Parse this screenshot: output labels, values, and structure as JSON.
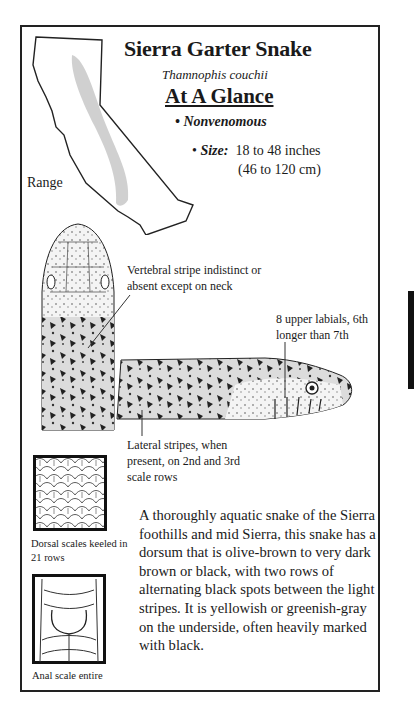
{
  "header": {
    "title": "Sierra Garter Snake",
    "scientific_name": "Thamnophis couchii",
    "section_heading": "At A Glance"
  },
  "facts": {
    "venom_status": "Nonvenomous",
    "size_label": "Size:",
    "size_imperial": "18 to 48 inches",
    "size_metric": "(46 to 120 cm)"
  },
  "map": {
    "label": "Range"
  },
  "callouts": {
    "vertebral_stripe": "Vertebral stripe indistinct or absent except on neck",
    "upper_labials": "8 upper labials, 6th longer than 7th",
    "lateral_stripes": "Lateral stripes, when present, on 2nd and 3rd scale rows"
  },
  "scale_figures": {
    "dorsal_caption": "Dorsal scales keeled in 21 rows",
    "anal_caption": "Anal scale entire"
  },
  "description": "A thoroughly aquatic snake of the Sierra foothills and mid Sierra, this snake has a dorsum that is olive-brown to very dark brown or black, with two rows of alternating black spots between the light stripes. It is yellowish or greenish-gray on the underside, often heavily marked with black."
}
